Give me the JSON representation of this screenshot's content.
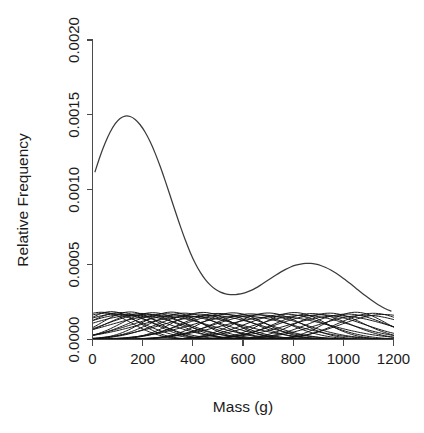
{
  "figure": {
    "clipped_header_text": "",
    "background_color": "#ffffff",
    "curve_color": "#3b3b3b",
    "component_color": "#121212",
    "axis_color": "#4a4a4a",
    "text_color": "#1b1b1b"
  },
  "chart_data": {
    "type": "line",
    "title": "",
    "xlabel": "Mass (g)",
    "ylabel": "Relative Frequency",
    "xlim": [
      0,
      1200
    ],
    "ylim": [
      0.0,
      0.002
    ],
    "xticks": [
      0,
      200,
      400,
      600,
      800,
      1000,
      1200
    ],
    "xticklabels": [
      "0",
      "200",
      "400",
      "600",
      "800",
      "1000",
      "1200"
    ],
    "yticks": [
      0.0,
      0.0005,
      0.001,
      0.0015,
      0.002
    ],
    "yticklabels": [
      "0.0000",
      "0.0005",
      "0.0010",
      "0.0015",
      "0.0020"
    ],
    "grid": false,
    "legend": "none",
    "series": [
      {
        "name": "mixture-density",
        "kind": "overall",
        "description": "Overall fitted mixture density, bimodal",
        "x": [
          10,
          30,
          50,
          70,
          90,
          110,
          130,
          150,
          170,
          190,
          210,
          230,
          250,
          270,
          290,
          310,
          330,
          350,
          370,
          390,
          410,
          430,
          450,
          470,
          490,
          510,
          530,
          550,
          570,
          590,
          610,
          630,
          650,
          670,
          690,
          710,
          730,
          750,
          770,
          790,
          810,
          830,
          850,
          870,
          890,
          910,
          930,
          950,
          970,
          990,
          1010,
          1030,
          1050,
          1070,
          1090,
          1110,
          1130,
          1150,
          1170,
          1190
        ],
        "y": [
          0.00112,
          0.001222,
          0.00131,
          0.001384,
          0.00144,
          0.001476,
          0.001492,
          0.001489,
          0.001469,
          0.001434,
          0.001384,
          0.00132,
          0.001243,
          0.001155,
          0.001059,
          0.000958,
          0.000856,
          0.000757,
          0.000664,
          0.00058,
          0.000508,
          0.000448,
          0.0004,
          0.000363,
          0.000335,
          0.000316,
          0.000305,
          0.0003,
          0.0003,
          0.000304,
          0.000313,
          0.000326,
          0.000343,
          0.000363,
          0.000385,
          0.000407,
          0.000429,
          0.00045,
          0.000468,
          0.000484,
          0.000496,
          0.000504,
          0.000508,
          0.000508,
          0.000503,
          0.000494,
          0.000481,
          0.000464,
          0.000444,
          0.000421,
          0.000396,
          0.00037,
          0.000343,
          0.000316,
          0.00029,
          0.000265,
          0.000242,
          0.000222,
          0.000204,
          0.00019
        ]
      },
      {
        "name": "component-densities",
        "kind": "components",
        "description": "Scaled individual mixture component densities drawn near the baseline",
        "components": [
          {
            "mean": 35,
            "sd": 120,
            "weight": 0.000182
          },
          {
            "mean": 55,
            "sd": 145,
            "weight": 0.000176
          },
          {
            "mean": 75,
            "sd": 110,
            "weight": 0.000186
          },
          {
            "mean": 95,
            "sd": 160,
            "weight": 0.00017
          },
          {
            "mean": 110,
            "sd": 130,
            "weight": 0.00018
          },
          {
            "mean": 130,
            "sd": 175,
            "weight": 0.000166
          },
          {
            "mean": 150,
            "sd": 115,
            "weight": 0.000184
          },
          {
            "mean": 170,
            "sd": 190,
            "weight": 0.000162
          },
          {
            "mean": 195,
            "sd": 140,
            "weight": 0.000174
          },
          {
            "mean": 215,
            "sd": 165,
            "weight": 0.000168
          },
          {
            "mean": 240,
            "sd": 125,
            "weight": 0.000179
          },
          {
            "mean": 265,
            "sd": 200,
            "weight": 0.000158
          },
          {
            "mean": 290,
            "sd": 150,
            "weight": 0.000172
          },
          {
            "mean": 315,
            "sd": 118,
            "weight": 0.000183
          },
          {
            "mean": 340,
            "sd": 185,
            "weight": 0.000163
          },
          {
            "mean": 365,
            "sd": 135,
            "weight": 0.000176
          },
          {
            "mean": 390,
            "sd": 210,
            "weight": 0.000155
          },
          {
            "mean": 415,
            "sd": 155,
            "weight": 0.00017
          },
          {
            "mean": 440,
            "sd": 122,
            "weight": 0.000181
          },
          {
            "mean": 470,
            "sd": 195,
            "weight": 0.00016
          },
          {
            "mean": 500,
            "sd": 145,
            "weight": 0.000174
          },
          {
            "mean": 530,
            "sd": 170,
            "weight": 0.000166
          },
          {
            "mean": 560,
            "sd": 128,
            "weight": 0.000178
          },
          {
            "mean": 595,
            "sd": 205,
            "weight": 0.000157
          },
          {
            "mean": 630,
            "sd": 150,
            "weight": 0.000171
          },
          {
            "mean": 665,
            "sd": 180,
            "weight": 0.000164
          },
          {
            "mean": 700,
            "sd": 132,
            "weight": 0.000177
          },
          {
            "mean": 735,
            "sd": 215,
            "weight": 0.000153
          },
          {
            "mean": 770,
            "sd": 160,
            "weight": 0.000169
          },
          {
            "mean": 805,
            "sd": 125,
            "weight": 0.00018
          },
          {
            "mean": 840,
            "sd": 190,
            "weight": 0.000161
          },
          {
            "mean": 875,
            "sd": 148,
            "weight": 0.000173
          },
          {
            "mean": 910,
            "sd": 175,
            "weight": 0.000165
          },
          {
            "mean": 945,
            "sd": 135,
            "weight": 0.000176
          },
          {
            "mean": 980,
            "sd": 200,
            "weight": 0.000158
          },
          {
            "mean": 1015,
            "sd": 155,
            "weight": 0.00017
          },
          {
            "mean": 1050,
            "sd": 120,
            "weight": 0.000182
          },
          {
            "mean": 1085,
            "sd": 185,
            "weight": 0.000162
          },
          {
            "mean": 1120,
            "sd": 142,
            "weight": 0.000175
          },
          {
            "mean": 1160,
            "sd": 168,
            "weight": 0.000167
          }
        ]
      }
    ]
  }
}
